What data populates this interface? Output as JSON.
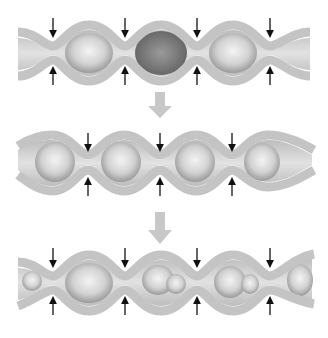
{
  "diagram": {
    "type": "peristalsis-sequence",
    "colors": {
      "wall": "#c4c4c4",
      "wall_edge": "#a8a8a8",
      "lumen": "#d8d8d8",
      "bolus": "#e6e6e6",
      "empty_chamber": "#8a8a8a",
      "arrow": "#111111",
      "step_arrow": "#c8c8c8",
      "background": "#ffffff"
    },
    "stages": [
      {
        "label": "stage-1",
        "constrictions_x": [
          53,
          125,
          197,
          270
        ],
        "bolus_chambers": [
          0,
          2
        ],
        "empty_chambers": [
          1
        ]
      },
      {
        "label": "stage-2",
        "constrictions_x": [
          88,
          160,
          232
        ],
        "bolus_chambers": [
          0,
          1,
          2,
          3
        ]
      },
      {
        "label": "stage-3",
        "constrictions_x": [
          53,
          125,
          197,
          270
        ],
        "bolus_chambers": [
          0,
          1,
          2,
          3,
          4
        ]
      }
    ],
    "transitions": 2
  }
}
